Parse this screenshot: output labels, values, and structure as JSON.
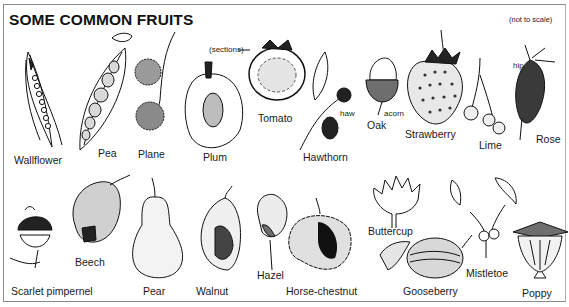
{
  "page": {
    "title": "SOME COMMON FRUITS",
    "note": "(not to scale)"
  },
  "fruits": {
    "wallflower": "Wallflower",
    "pea": "Pea",
    "plane": "Plane",
    "plum": "Plum",
    "tomato": "Tomato",
    "tomato_note": "(sections)",
    "hawthorn": "Hawthorn",
    "hawthorn_note": "haw",
    "oak": "Oak",
    "oak_note": "acorn",
    "strawberry": "Strawberry",
    "lime": "Lime",
    "rose": "Rose",
    "rose_note": "hip",
    "scarlet_pimpernel": "Scarlet pimpernel",
    "beech": "Beech",
    "pear": "Pear",
    "walnut": "Walnut",
    "hazel": "Hazel",
    "horse_chestnut": "Horse-chestnut",
    "buttercup": "Buttercup",
    "gooseberry": "Gooseberry",
    "mistletoe": "Mistletoe",
    "poppy": "Poppy"
  },
  "colors": {
    "ink": "#111111",
    "background": "#ffffff",
    "border": "#8a8a8a"
  }
}
